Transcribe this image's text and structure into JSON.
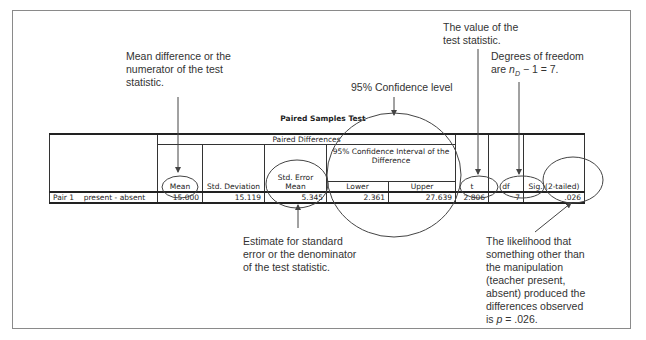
{
  "table": {
    "title": "Paired Samples Test",
    "group_header": "Paired Differences",
    "ci_header": "95% Confidence Interval of the Difference",
    "columns": {
      "mean": "Mean",
      "std_deviation": "Std. Deviation",
      "std_error_mean": "Std. Error Mean",
      "lower": "Lower",
      "upper": "Upper",
      "t": "t",
      "df": "df",
      "sig": "Sig. (2-tailed)"
    },
    "rows": [
      {
        "pair": "Pair 1",
        "label": "present - absent",
        "mean": "15.000",
        "std_deviation": "15.119",
        "std_error_mean": "5.345",
        "lower": "2.361",
        "upper": "27.639",
        "t": "2.806",
        "df": "7",
        "sig": ".026"
      }
    ]
  },
  "callouts": {
    "mean": "Mean difference or the numerator of the test statistic.",
    "ci": "95% Confidence level",
    "t": "The value of the test statistic.",
    "df_prefix": "Degrees of freedom are ",
    "df_var": "n",
    "df_sub": "D",
    "df_suffix": " − 1 = 7.",
    "se": "Estimate for standard error or the denominator of the test statistic.",
    "sig_prefix": "The likelihood that something other than the manipulation (teacher present, absent) produced the differences observed is ",
    "sig_var": "p",
    "sig_suffix": " = .026."
  }
}
